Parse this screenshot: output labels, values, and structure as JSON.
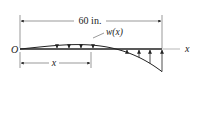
{
  "diagram": {
    "span_label": "60 in.",
    "load_label": "w(x)",
    "origin_label": "O",
    "axis_label": "x",
    "position_label": "x",
    "colors": {
      "ink": "#222222",
      "dim": "#555555",
      "axis": "#999999"
    }
  }
}
